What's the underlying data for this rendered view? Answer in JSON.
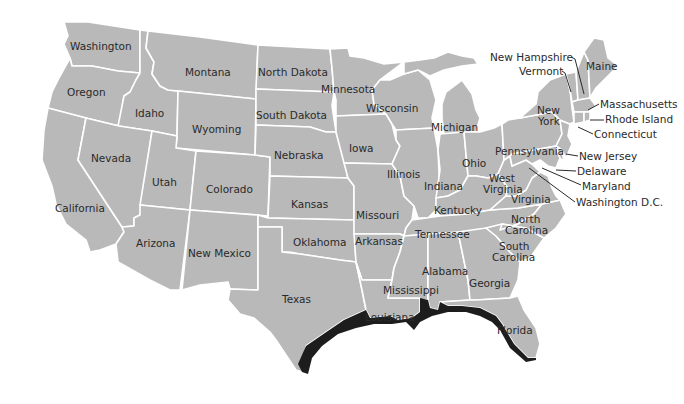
{
  "map": {
    "title": "United States map",
    "colors": {
      "land": "#b9b9b9",
      "borders": "#ffffff",
      "coastal_highlight": "#1d1d1d",
      "label": "#2a2a2a",
      "background": "#ffffff"
    },
    "highlighted_region": "Gulf Coast shoreline (Texas to Florida)",
    "labels": {
      "washington": "Washington",
      "oregon": "Oregon",
      "california": "California",
      "idaho": "Idaho",
      "nevada": "Nevada",
      "montana": "Montana",
      "wyoming": "Wyoming",
      "utah": "Utah",
      "arizona": "Arizona",
      "colorado": "Colorado",
      "new_mexico": "New Mexico",
      "north_dakota": "North Dakota",
      "south_dakota": "South Dakota",
      "nebraska": "Nebraska",
      "kansas": "Kansas",
      "oklahoma": "Oklahoma",
      "texas": "Texas",
      "minnesota": "Minnesota",
      "iowa": "Iowa",
      "missouri": "Missouri",
      "arkansas": "Arkansas",
      "louisiana": "Louisiana",
      "wisconsin": "Wisconsin",
      "illinois": "Illinois",
      "michigan": "Michigan",
      "indiana": "Indiana",
      "ohio": "Ohio",
      "kentucky": "Kentucky",
      "tennessee": "Tennessee",
      "mississippi": "Mississippi",
      "alabama": "Alabama",
      "georgia": "Georgia",
      "florida": "Florida",
      "south_carolina_1": "South",
      "south_carolina_2": "Carolina",
      "north_carolina_1": "North",
      "north_carolina_2": "Carolina",
      "virginia": "Virginia",
      "west_virginia_1": "West",
      "west_virginia_2": "Virginia",
      "pennsylvania": "Pennsylvania",
      "new_york_1": "New",
      "new_york_2": "York",
      "maine": "Maine",
      "new_hampshire": "New Hampshire",
      "vermont": "Vermont",
      "massachusetts": "Massachusetts",
      "rhode_island": "Rhode Island",
      "connecticut": "Connecticut",
      "new_jersey": "New Jersey",
      "delaware": "Delaware",
      "maryland": "Maryland",
      "washington_dc": "Washington D.C."
    }
  }
}
